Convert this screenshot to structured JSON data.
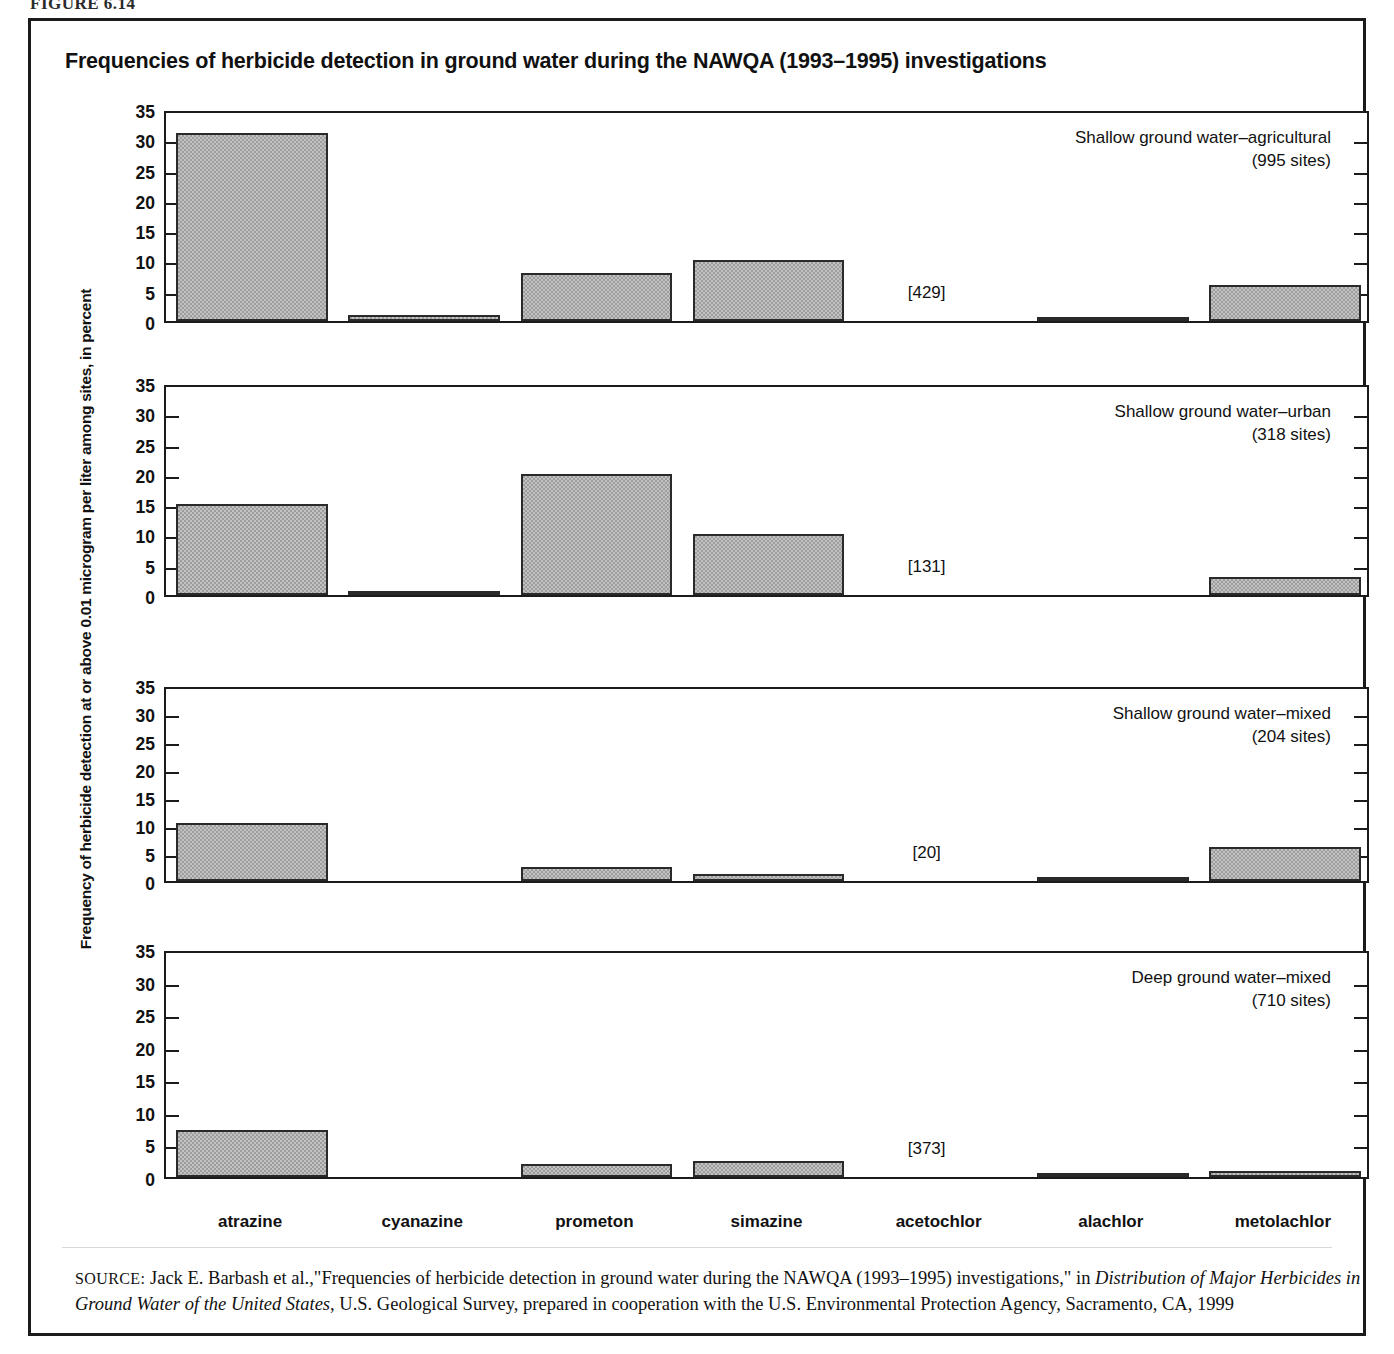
{
  "figure_label": "FIGURE 6.14",
  "chart_title": "Frequencies of herbicide detection in ground water during the NAWQA (1993–1995) investigations",
  "y_axis_title": "Frequency of herbicide detection at or above 0.01 microgram per liter among sites, in percent",
  "source": {
    "kicker": "SOURCE:",
    "text_1": " Jack E. Barbash et al.,\"Frequencies of herbicide detection in ground water during the NAWQA (1993–1995) investigations,\" in ",
    "italic_1": "Distribution of Major Herbicides in Ground Water of the United States",
    "text_2": ", U.S. Geological Survey, prepared in cooperation with the U.S. Environmental Protection Agency, Sacramento, CA, 1999"
  },
  "colors": {
    "bar_fill": "#9d9d9d",
    "bar_stroke": "#2a2a2a",
    "axis": "#1b1b1b",
    "background": "#ffffff",
    "text": "#111111"
  },
  "chart_data": {
    "type": "bar",
    "title": "Frequencies of herbicide detection in ground water during the NAWQA (1993–1995) investigations",
    "xlabel": "",
    "ylabel": "Frequency of herbicide detection at or above 0.01 microgram per liter among sites, in percent",
    "ylim": [
      0,
      35
    ],
    "yticks": [
      0,
      5,
      10,
      15,
      20,
      25,
      30,
      35
    ],
    "grid": false,
    "legend_position": "inside-top-right-per-panel",
    "categories": [
      "atrazine",
      "cyanazine",
      "prometon",
      "simazine",
      "acetochlor",
      "alachlor",
      "metolachlor"
    ],
    "panels": [
      {
        "name": "Shallow ground water–agricultural",
        "label_line1": "Shallow ground water–agricultural",
        "label_line2": "(995 sites)",
        "sites": 995,
        "annotation": "[429]",
        "annotation_category": "acetochlor",
        "values": [
          31.0,
          1.0,
          8.0,
          10.0,
          0.0,
          0.3,
          6.0
        ]
      },
      {
        "name": "Shallow ground water–urban",
        "label_line1": "Shallow ground water–urban",
        "label_line2": "(318 sites)",
        "sites": 318,
        "annotation": "[131]",
        "annotation_category": "acetochlor",
        "values": [
          15.0,
          0.6,
          20.0,
          10.0,
          0.0,
          0.0,
          3.0
        ]
      },
      {
        "name": "Shallow ground water–mixed",
        "label_line1": "Shallow ground water–mixed",
        "label_line2": "(204 sites)",
        "sites": 204,
        "annotation": "[20]",
        "annotation_category": "acetochlor",
        "values": [
          10.3,
          0.0,
          2.5,
          1.2,
          0.0,
          0.4,
          6.0
        ]
      },
      {
        "name": "Deep ground water–mixed",
        "label_line1": "Deep ground water–mixed",
        "label_line2": "(710 sites)",
        "sites": 710,
        "annotation": "[373]",
        "annotation_category": "acetochlor",
        "values": [
          7.2,
          0.0,
          2.0,
          2.4,
          0.0,
          0.3,
          1.0
        ]
      }
    ]
  }
}
